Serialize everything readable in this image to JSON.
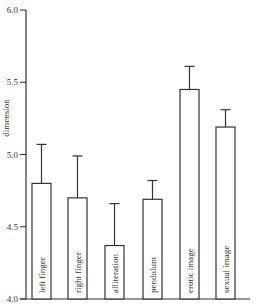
{
  "chart_data": {
    "type": "bar",
    "title": "",
    "xlabel": "",
    "ylabel": "dimension",
    "ylim": [
      4.0,
      6.0
    ],
    "yticks": [
      4.0,
      4.5,
      5.0,
      5.5,
      6.0
    ],
    "ytick_labels": [
      "4.0",
      "4.5",
      "5.0",
      "5.5",
      "6.0"
    ],
    "grid": false,
    "legend": null,
    "categories": [
      "left finger",
      "right finger",
      "alliteration",
      "pendulum",
      "erotic image",
      "sexual image"
    ],
    "values": [
      4.8,
      4.7,
      4.37,
      4.69,
      5.45,
      5.19
    ],
    "error_upper": [
      5.07,
      4.99,
      4.66,
      4.82,
      5.61,
      5.31
    ],
    "error_bars": "upper only (T-shaped)",
    "bar_fill": "#ffffff",
    "bar_stroke": "#333333",
    "bar_labels_inside_vertical": true
  }
}
